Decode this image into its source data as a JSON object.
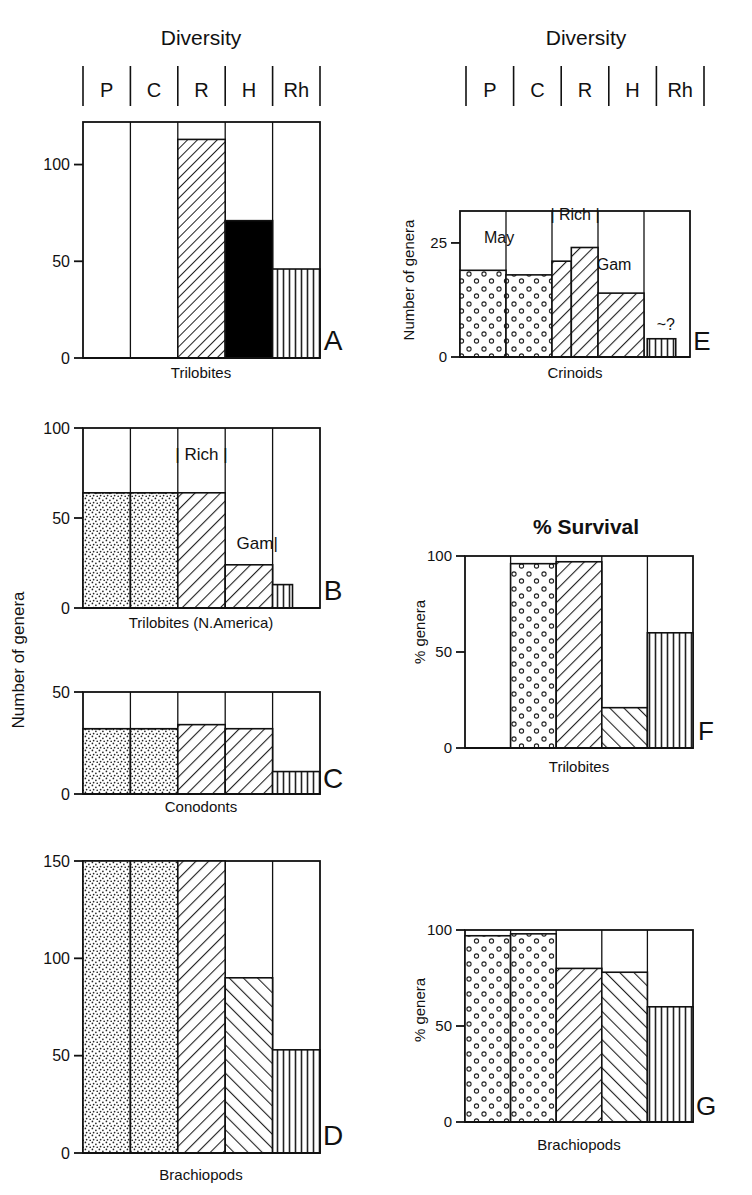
{
  "figure": {
    "headers": [
      {
        "id": "left",
        "title": "Diversity"
      },
      {
        "id": "right",
        "title": "Diversity"
      }
    ],
    "survival_title": "% Survival",
    "stage_labels": [
      "P",
      "C",
      "R",
      "H",
      "Rh"
    ],
    "axis_titles": {
      "number_of_genera": "Number of genera",
      "percent_genera": "% genera"
    }
  },
  "chart_data": [
    {
      "panel": "A",
      "type": "bar",
      "title": "Diversity",
      "xlabel": "Trilobites",
      "ylabel": "Number of genera",
      "categories": [
        "P",
        "C",
        "R",
        "H",
        "Rh"
      ],
      "values": [
        0,
        0,
        113,
        71,
        46
      ],
      "patterns": [
        "none",
        "none",
        "hatch-dense-right",
        "hatch-wide-left",
        "vertical"
      ],
      "ylim": [
        0,
        122
      ],
      "yticks": [
        0,
        50,
        100
      ],
      "ytick_labels": [
        "0",
        "50",
        "100"
      ],
      "grid": false,
      "annotations": []
    },
    {
      "panel": "B",
      "type": "bar",
      "title": "Diversity",
      "xlabel": "Trilobites (N.America)",
      "ylabel": "Number of genera",
      "categories": [
        "P",
        "C",
        "R",
        "H",
        "Rh"
      ],
      "values": [
        64,
        64,
        64,
        24,
        13
      ],
      "patterns": [
        "stipple",
        "stipple",
        "hatch-right",
        "hatch-right",
        "vertical"
      ],
      "ylim": [
        0,
        100
      ],
      "yticks": [
        0,
        50,
        100
      ],
      "ytick_labels": [
        "0",
        "50",
        "100"
      ],
      "grid": false,
      "annotations": [
        {
          "text": "| Rich |",
          "x_frac": 0.5,
          "value": 82
        },
        {
          "text": "Gam|",
          "x_frac": 0.735,
          "value": 33
        }
      ]
    },
    {
      "panel": "C",
      "type": "bar",
      "title": "Diversity",
      "xlabel": "Conodonts",
      "ylabel": "Number of genera",
      "categories": [
        "P",
        "C",
        "R",
        "H",
        "Rh"
      ],
      "values": [
        32,
        32,
        34,
        32,
        11
      ],
      "patterns": [
        "stipple",
        "stipple",
        "hatch-right",
        "hatch-right",
        "vertical"
      ],
      "ylim": [
        0,
        50
      ],
      "yticks": [
        0,
        50
      ],
      "ytick_labels": [
        "0",
        "50"
      ],
      "grid": false,
      "annotations": []
    },
    {
      "panel": "D",
      "type": "bar",
      "title": "Diversity",
      "xlabel": "Brachiopods",
      "ylabel": "Number of genera",
      "categories": [
        "P",
        "C",
        "R",
        "H",
        "Rh"
      ],
      "values": [
        150,
        150,
        150,
        90,
        53
      ],
      "patterns": [
        "stipple",
        "stipple",
        "hatch-right",
        "hatch-left",
        "vertical"
      ],
      "ylim": [
        0,
        150
      ],
      "yticks": [
        0,
        50,
        100,
        150
      ],
      "ytick_labels": [
        "0",
        "50",
        "100",
        "150"
      ],
      "grid": false,
      "annotations": []
    },
    {
      "panel": "E",
      "type": "bar",
      "title": "Diversity",
      "xlabel": "Crinoids",
      "ylabel": "Number of genera",
      "categories": [
        "P",
        "C",
        "R",
        "H",
        "Rh"
      ],
      "values": [
        19,
        18,
        24,
        14,
        4
      ],
      "sub_values": {
        "R_first": 21,
        "R_second": 24
      },
      "patterns": [
        "circles",
        "circles",
        "hatch-right",
        "hatch-right",
        "vertical"
      ],
      "ylim": [
        0,
        32
      ],
      "yticks": [
        0,
        25
      ],
      "ytick_labels": [
        "0",
        "25"
      ],
      "grid": false,
      "annotations": [
        {
          "text": "May",
          "x_frac": 0.17,
          "value": 25
        },
        {
          "text": "| Rich |",
          "x_frac": 0.5,
          "value": 30
        },
        {
          "text": "Gam",
          "x_frac": 0.67,
          "value": 19
        },
        {
          "text": "~?",
          "x_frac": 0.895,
          "value": 6
        }
      ]
    },
    {
      "panel": "F",
      "type": "bar",
      "title": "% Survival",
      "xlabel": "Trilobites",
      "ylabel": "% genera",
      "categories": [
        "P",
        "C",
        "R",
        "H",
        "Rh"
      ],
      "values": [
        0,
        96,
        97,
        21,
        60
      ],
      "patterns": [
        "none",
        "circles",
        "hatch-right",
        "hatch-left",
        "vertical"
      ],
      "ylim": [
        0,
        100
      ],
      "yticks": [
        0,
        50,
        100
      ],
      "ytick_labels": [
        "0",
        "50",
        "100"
      ],
      "grid": false,
      "annotations": []
    },
    {
      "panel": "G",
      "type": "bar",
      "title": "% Survival",
      "xlabel": "Brachiopods",
      "ylabel": "% genera",
      "categories": [
        "P",
        "C",
        "R",
        "H",
        "Rh"
      ],
      "values": [
        97,
        98,
        80,
        78,
        60
      ],
      "patterns": [
        "circles",
        "circles",
        "hatch-right",
        "hatch-left",
        "vertical"
      ],
      "ylim": [
        0,
        100
      ],
      "yticks": [
        0,
        50,
        100
      ],
      "ytick_labels": [
        "0",
        "50",
        "100"
      ],
      "grid": false,
      "annotations": []
    }
  ],
  "panel_letters": [
    "A",
    "B",
    "C",
    "D",
    "E",
    "F",
    "G"
  ],
  "colors": {
    "ink": "#111111",
    "background": "#ffffff"
  }
}
